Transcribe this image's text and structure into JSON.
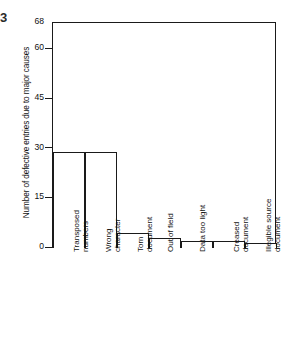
{
  "figure": {
    "corner_mark": "3",
    "ylabel": "Number of defective entries due to major causes"
  },
  "chart_data": {
    "type": "bar",
    "title": "",
    "xlabel": "",
    "ylabel": "Number of defective entries due to major causes",
    "categories": [
      "Transposed numbers",
      "Wrong character",
      "Torn document",
      "Out of field",
      "Data too light",
      "Creased document",
      "Illegible source document"
    ],
    "category_lines": [
      [
        "Transposed",
        "numbers"
      ],
      [
        "Wrong",
        "character"
      ],
      [
        "Torn",
        "document"
      ],
      [
        "Out of field"
      ],
      [
        "Data too light"
      ],
      [
        "Creased",
        "document"
      ],
      [
        "Illegible source",
        "document"
      ]
    ],
    "values": [
      29,
      29,
      4.5,
      3,
      2,
      2,
      1.5
    ],
    "ylim": [
      0,
      68
    ],
    "yticks": [
      0,
      15,
      30,
      45,
      60,
      68
    ],
    "ytick_labels": [
      "0",
      "15",
      "30",
      "45",
      "60",
      "68"
    ],
    "grid": false,
    "legend": null,
    "bar_fill": "#ffffff",
    "bar_edge": "#1a1a1a"
  }
}
